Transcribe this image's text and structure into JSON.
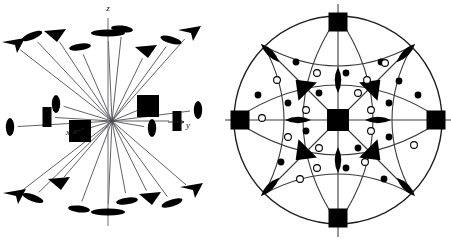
{
  "figure": {
    "background_color": "#ffffff",
    "ink_color": "#000000",
    "line_color": "#3a3a3a",
    "width": 451,
    "height": 241,
    "panel_count": 2
  },
  "panels": [
    {
      "id": "perspective-view",
      "name": "three-dimensional perspective diagram",
      "description": "Oblique perspective drawing of the full set of rotation axes of the cubic class, each axis drawn as a line from the common origin terminating in its graphical symbol.",
      "center": {
        "x": 112,
        "y": 121
      },
      "axis_labels": [
        {
          "label": "z",
          "x": 108,
          "y": 11,
          "name": "axis-label-z"
        },
        {
          "label": "y",
          "x": 188,
          "y": 128,
          "name": "axis-label-y"
        },
        {
          "label": "x",
          "x": 68,
          "y": 135,
          "name": "axis-label-x"
        }
      ],
      "arrow_heads": [
        {
          "for": "y",
          "x1": 168,
          "y1": 122,
          "x2": 184,
          "y2": 122
        },
        {
          "for": "x",
          "x1": 84,
          "y1": 128,
          "x2": 73,
          "y2": 133
        }
      ],
      "vertical_axis": {
        "x": 108,
        "y_top": 18,
        "y_bottom": 226
      },
      "symbol_legend": {
        "filled_square": "four-fold rotation axis (4)",
        "filled_triangle": "three-fold rotation axis (3)",
        "filled_lens": "two-fold rotation axis (2)"
      },
      "axes": [
        {
          "name": "fourfold-up",
          "symbol": "lens-flat",
          "x": 108,
          "y": 33,
          "order": 4,
          "tilt": 0
        },
        {
          "name": "fourfold-down",
          "symbol": "lens-flat",
          "x": 108,
          "y": 212,
          "order": 4,
          "tilt": 0
        },
        {
          "name": "fourfold-right",
          "symbol": "square",
          "x": 148,
          "y": 106,
          "order": 4,
          "tilt": 0
        },
        {
          "name": "fourfold-left",
          "symbol": "square",
          "x": 80,
          "y": 131,
          "order": 4,
          "tilt": 0
        },
        {
          "name": "twofold-ne-square",
          "symbol": "square-thin",
          "x": 177,
          "y": 121,
          "order": 2,
          "tilt": 0
        },
        {
          "name": "twofold-nw-square",
          "symbol": "square-thin",
          "x": 47,
          "y": 117,
          "order": 2,
          "tilt": 0
        },
        {
          "name": "threefold-ul",
          "symbol": "triangle",
          "x": 55,
          "y": 35,
          "order": 3,
          "tilt": 0
        },
        {
          "name": "threefold-ur",
          "symbol": "triangle",
          "x": 146,
          "y": 51,
          "order": 3,
          "tilt": 0
        },
        {
          "name": "threefold-ll",
          "symbol": "triangle",
          "x": 59,
          "y": 183,
          "order": 3,
          "tilt": 0
        },
        {
          "name": "threefold-lr",
          "symbol": "triangle",
          "x": 150,
          "y": 198,
          "order": 3,
          "tilt": 0
        },
        {
          "name": "twofold-far-ul",
          "symbol": "arrow",
          "x": 14,
          "y": 45,
          "order": 2,
          "tilt": 0
        },
        {
          "name": "twofold-far-ur",
          "symbol": "arrow",
          "x": 190,
          "y": 33,
          "order": 2,
          "tilt": 0
        },
        {
          "name": "twofold-far-ll",
          "symbol": "arrow",
          "x": 15,
          "y": 196,
          "order": 2,
          "tilt": 0
        },
        {
          "name": "twofold-far-lr",
          "symbol": "arrow",
          "x": 192,
          "y": 190,
          "order": 2,
          "tilt": 0
        },
        {
          "name": "twofold-lens-ul",
          "symbol": "lens",
          "x": 32,
          "y": 36,
          "order": 2,
          "tilt": -22
        },
        {
          "name": "twofold-lens-uc",
          "symbol": "lens",
          "x": 80,
          "y": 47,
          "order": 2,
          "tilt": -8
        },
        {
          "name": "twofold-lens-ur",
          "symbol": "lens",
          "x": 122,
          "y": 29,
          "order": 2,
          "tilt": 6
        },
        {
          "name": "twofold-lens-urr",
          "symbol": "lens",
          "x": 171,
          "y": 40,
          "order": 2,
          "tilt": 16
        },
        {
          "name": "twofold-lens-mid-l",
          "symbol": "lens-v",
          "x": 56,
          "y": 104,
          "order": 2,
          "tilt": 0
        },
        {
          "name": "twofold-lens-mid-r",
          "symbol": "lens-v",
          "x": 152,
          "y": 128,
          "order": 2,
          "tilt": 0
        },
        {
          "name": "twofold-lens-far-l",
          "symbol": "lens-v",
          "x": 10,
          "y": 127,
          "order": 2,
          "tilt": 0
        },
        {
          "name": "twofold-lens-far-r",
          "symbol": "lens-v",
          "x": 198,
          "y": 110,
          "order": 2,
          "tilt": 0
        },
        {
          "name": "twofold-lens-ll",
          "symbol": "lens",
          "x": 33,
          "y": 198,
          "order": 2,
          "tilt": 20
        },
        {
          "name": "twofold-lens-lc",
          "symbol": "lens",
          "x": 79,
          "y": 209,
          "order": 2,
          "tilt": 6
        },
        {
          "name": "twofold-lens-lr",
          "symbol": "lens",
          "x": 127,
          "y": 201,
          "order": 2,
          "tilt": -8
        },
        {
          "name": "twofold-lens-lrr",
          "symbol": "lens",
          "x": 172,
          "y": 203,
          "order": 2,
          "tilt": -18
        }
      ]
    },
    {
      "id": "stereographic-projection",
      "name": "stereographic projection diagram",
      "description": "Stereogram of the cubic point group m-3m showing mirror plane traces, rotation-axis symbols and the general form of 48 equivalent points.",
      "center": {
        "x": 338,
        "y": 120
      },
      "circle_radius": 104,
      "symbol_legend": {
        "filled_square": "four-fold rotation axis (4)",
        "filled_triangle": "three-fold rotation axis (3)",
        "filled_lens": "two-fold rotation axis (2)",
        "filled_circle": "general point above the plane of projection",
        "open_circle": "general point below the plane of projection"
      },
      "fourfold_squares": [
        {
          "name": "fourfold-center",
          "x": 338,
          "y": 120,
          "size": 22
        },
        {
          "name": "fourfold-north",
          "x": 338,
          "y": 22,
          "size": 19
        },
        {
          "name": "fourfold-south",
          "x": 338,
          "y": 218,
          "size": 19
        },
        {
          "name": "fourfold-west",
          "x": 240,
          "y": 120,
          "size": 19
        },
        {
          "name": "fourfold-east",
          "x": 436,
          "y": 120,
          "size": 19
        }
      ],
      "axis_stubs": [
        {
          "name": "stub-north",
          "x1": 338,
          "y1": 4,
          "x2": 338,
          "y2": 14
        },
        {
          "name": "stub-south",
          "x1": 338,
          "y1": 227,
          "x2": 338,
          "y2": 237
        },
        {
          "name": "stub-west",
          "x1": 222,
          "y1": 120,
          "x2": 232,
          "y2": 120
        },
        {
          "name": "stub-east",
          "x1": 444,
          "y1": 120,
          "x2": 451,
          "y2": 120
        }
      ],
      "threefold_triangles": [
        {
          "name": "threefold-ne",
          "x": 374,
          "y": 86,
          "rot": 225
        },
        {
          "name": "threefold-nw",
          "x": 302,
          "y": 86,
          "rot": 135
        },
        {
          "name": "threefold-se",
          "x": 374,
          "y": 154,
          "rot": 315
        },
        {
          "name": "threefold-sw",
          "x": 302,
          "y": 154,
          "rot": 45
        }
      ],
      "twofold_lenses": [
        {
          "name": "twofold-up",
          "x": 338,
          "y": 80,
          "rot": 90
        },
        {
          "name": "twofold-down",
          "x": 338,
          "y": 160,
          "rot": 90
        },
        {
          "name": "twofold-left",
          "x": 298,
          "y": 120,
          "rot": 0
        },
        {
          "name": "twofold-right",
          "x": 378,
          "y": 120,
          "rot": 0
        },
        {
          "name": "twofold-diag-nw",
          "x": 270,
          "y": 53,
          "rot": 45
        },
        {
          "name": "twofold-diag-ne",
          "x": 406,
          "y": 53,
          "rot": 135
        },
        {
          "name": "twofold-diag-sw",
          "x": 270,
          "y": 187,
          "rot": 135
        },
        {
          "name": "twofold-diag-se",
          "x": 406,
          "y": 187,
          "rot": 45
        }
      ],
      "general_points": [
        {
          "type": "filled",
          "x": 296,
          "y": 62
        },
        {
          "type": "open",
          "x": 277,
          "y": 80
        },
        {
          "type": "open",
          "x": 317,
          "y": 73
        },
        {
          "type": "filled",
          "x": 346,
          "y": 73
        },
        {
          "type": "filled",
          "x": 381,
          "y": 62
        },
        {
          "type": "open",
          "x": 385,
          "y": 63
        },
        {
          "type": "open",
          "x": 367,
          "y": 80
        },
        {
          "type": "filled",
          "x": 399,
          "y": 81
        },
        {
          "type": "filled",
          "x": 319,
          "y": 93
        },
        {
          "type": "open",
          "x": 358,
          "y": 93
        },
        {
          "type": "filled",
          "x": 288,
          "y": 103
        },
        {
          "type": "open",
          "x": 306,
          "y": 110
        },
        {
          "type": "open",
          "x": 371,
          "y": 110
        },
        {
          "type": "filled",
          "x": 389,
          "y": 103
        },
        {
          "type": "open",
          "x": 288,
          "y": 137
        },
        {
          "type": "filled",
          "x": 306,
          "y": 131
        },
        {
          "type": "open",
          "x": 371,
          "y": 131
        },
        {
          "type": "filled",
          "x": 389,
          "y": 137
        },
        {
          "type": "open",
          "x": 319,
          "y": 148
        },
        {
          "type": "filled",
          "x": 358,
          "y": 148
        },
        {
          "type": "filled",
          "x": 281,
          "y": 162
        },
        {
          "type": "open",
          "x": 300,
          "y": 179
        },
        {
          "type": "open",
          "x": 317,
          "y": 168
        },
        {
          "type": "filled",
          "x": 346,
          "y": 168
        },
        {
          "type": "open",
          "x": 365,
          "y": 162
        },
        {
          "type": "filled",
          "x": 384,
          "y": 179
        },
        {
          "type": "filled",
          "x": 258,
          "y": 95
        },
        {
          "type": "open",
          "x": 262,
          "y": 118
        },
        {
          "type": "filled",
          "x": 418,
          "y": 95
        },
        {
          "type": "open",
          "x": 414,
          "y": 145
        }
      ]
    }
  ]
}
